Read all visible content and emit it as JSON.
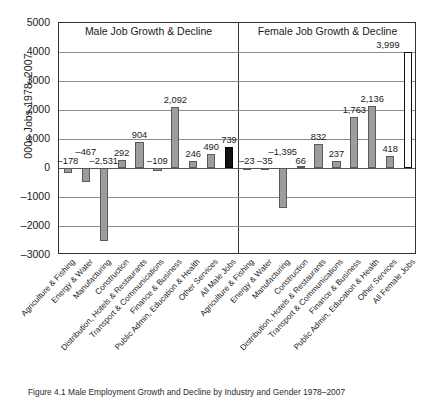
{
  "figure": {
    "caption": "Figure 4.1  Male Employment Growth and Decline by Industry and Gender 1978–2007"
  },
  "axis": {
    "ylabel": "000s Jobs 1978–2007",
    "yticks": [
      "5000",
      "4000",
      "3000",
      "2000",
      "1000",
      "0",
      "–1000",
      "–2000",
      "–3000"
    ]
  },
  "panels": {
    "male_title": "Male Job Growth & Decline",
    "female_title": "Female Job Growth & Decline"
  },
  "chart_data": {
    "type": "bar",
    "xlabel": "",
    "ylabel": "000s Jobs 1978–2007",
    "ylim": [
      -3000,
      5000
    ],
    "ytick_step": 1000,
    "grid": true,
    "legend": "none",
    "panels": [
      {
        "name": "Male Job Growth & Decline",
        "categories": [
          "Agriculture & Fishing",
          "Energy & Water",
          "Manufacturing",
          "Construction",
          "Distribution, Hotels & Restaurants",
          "Transport & Communications",
          "Finance & Business",
          "Public Admin, Education & Health",
          "Other Services",
          "All Male Jobs"
        ],
        "values": [
          -178,
          -467,
          -2531,
          292,
          904,
          -109,
          2092,
          246,
          490,
          739
        ],
        "labels": [
          "–178",
          "–467",
          "–2,531",
          "292",
          "904",
          "–109",
          "2,092",
          "246",
          "490",
          "739"
        ],
        "bar_styles": [
          "fill",
          "fill",
          "fill",
          "fill",
          "fill",
          "fill",
          "fill",
          "fill",
          "fill",
          "total"
        ]
      },
      {
        "name": "Female Job Growth & Decline",
        "categories": [
          "Agriculture & Fishing",
          "Energy & Water",
          "Manufacturing",
          "Construction",
          "Distribution, Hotels & Restaurants",
          "Transport & Communications",
          "Finance & Business",
          "Public Admin, Education & Health",
          "Other Services",
          "All Female Jobs"
        ],
        "values": [
          -23,
          -35,
          -1395,
          66,
          832,
          237,
          1763,
          2136,
          418,
          3999
        ],
        "labels": [
          "–23",
          "–35",
          "–1,395",
          "66",
          "832",
          "237",
          "1,763",
          "2,136",
          "418",
          "3,999"
        ],
        "bar_styles": [
          "fill",
          "fill",
          "fill",
          "fill",
          "fill",
          "fill",
          "fill",
          "fill",
          "fill",
          "hollow"
        ]
      }
    ],
    "colors": {
      "bar_fill": "#9d9d9d",
      "bar_edge": "#5a5a5a",
      "total_bar": "#111111",
      "hollow_bar": "#ffffff",
      "grid": "#8c8c8c",
      "frame": "#333333"
    }
  }
}
